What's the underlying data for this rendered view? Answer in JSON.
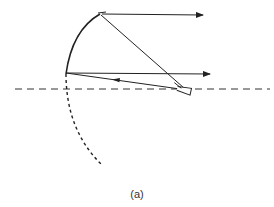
{
  "figure": {
    "caption": "(a)",
    "colors": {
      "line": "#222222",
      "axis": "#333333",
      "background": "#ffffff"
    },
    "elements": {
      "reflector": "solid parabolic arc (upper portion of reflector)",
      "reflector_extension": "dashed arc continuing the parabola below the axis",
      "axis": "dashed horizontal axis line",
      "feed": "small feed horn at the focal point on the axis",
      "rays": [
        {
          "name": "upper-ray",
          "path": "feed to top of reflector, reflected horizontally to the right"
        },
        {
          "name": "lower-ray",
          "path": "feed to bottom edge of reflector, reflected horizontally to the right"
        }
      ]
    }
  }
}
